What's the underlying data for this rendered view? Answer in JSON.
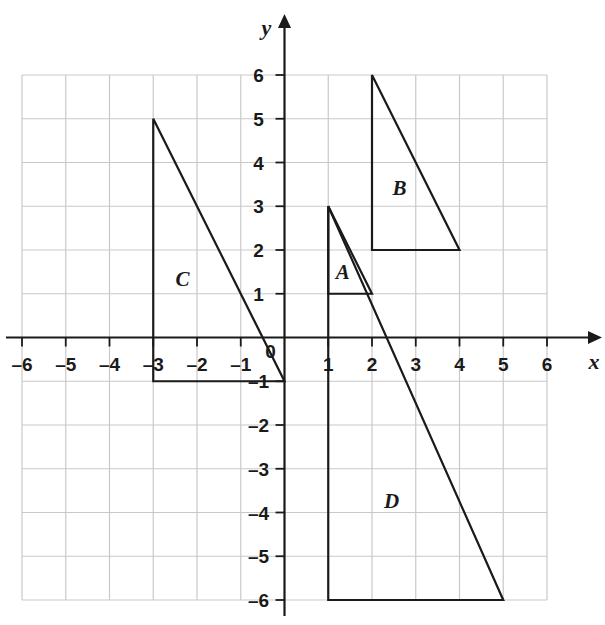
{
  "chart_data": {
    "type": "scatter",
    "title": "",
    "xlabel": "x",
    "ylabel": "y",
    "xlim": [
      -6,
      6
    ],
    "ylim": [
      -6,
      6
    ],
    "grid": true,
    "legend": "none",
    "x_ticks": [
      "–6",
      "–5",
      "–4",
      "–3",
      "–2",
      "–1",
      "0",
      "1",
      "2",
      "3",
      "4",
      "5",
      "6"
    ],
    "x_tick_values": [
      -6,
      -5,
      -4,
      -3,
      -2,
      -1,
      0,
      1,
      2,
      3,
      4,
      5,
      6
    ],
    "y_ticks": [
      "6",
      "5",
      "4",
      "3",
      "2",
      "1",
      "–1",
      "–2",
      "–3",
      "–4",
      "–5",
      "–6"
    ],
    "y_tick_values": [
      6,
      5,
      4,
      3,
      2,
      1,
      -1,
      -2,
      -3,
      -4,
      -5,
      -6
    ],
    "origin_label": "0",
    "shapes": [
      {
        "name": "A",
        "label": "A",
        "kind": "right-triangle",
        "vertices": [
          [
            1,
            3
          ],
          [
            1,
            1
          ],
          [
            2,
            1
          ]
        ],
        "label_position": [
          1.33,
          1.5
        ]
      },
      {
        "name": "B",
        "label": "B",
        "kind": "right-triangle",
        "vertices": [
          [
            2,
            6
          ],
          [
            2,
            2
          ],
          [
            4,
            2
          ]
        ],
        "label_position": [
          2.63,
          3.42
        ]
      },
      {
        "name": "C",
        "label": "C",
        "kind": "right-triangle",
        "vertices": [
          [
            -3,
            5
          ],
          [
            -3,
            -1
          ],
          [
            0,
            -1
          ]
        ],
        "label_position": [
          -2.33,
          1.33
        ]
      },
      {
        "name": "D",
        "label": "D",
        "kind": "right-triangle",
        "vertices": [
          [
            1,
            3
          ],
          [
            1,
            -6
          ],
          [
            5,
            -6
          ]
        ],
        "label_position": [
          2.45,
          -3.73
        ]
      }
    ],
    "colors": {
      "grid": "#c9c9c9",
      "axis": "#1a1a1a",
      "shape_stroke": "#1a1a1a",
      "background": "#ffffff"
    }
  }
}
